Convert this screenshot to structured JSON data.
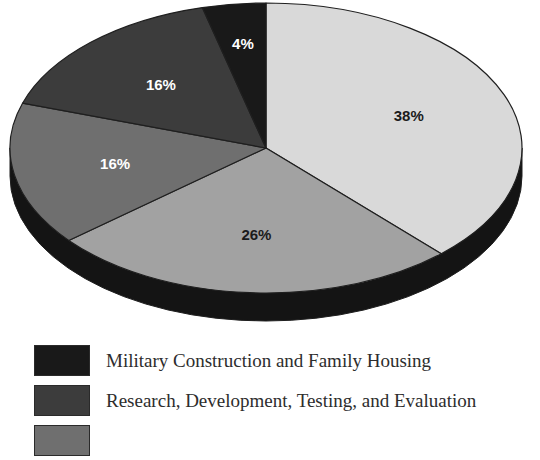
{
  "chart_data": {
    "type": "pie",
    "title": "",
    "subtitle": "",
    "xlabel": "",
    "ylabel": "",
    "legend_position": "bottom-left",
    "three_d": true,
    "start_angle_deg": 0,
    "direction": "clockwise",
    "labels_shown_on_slices": true,
    "categories": [
      "Military Personnel",
      "Operations and Maintenance",
      "Procurement",
      "Research, Development, Testing, and Evaluation",
      "Military Construction and Family Housing"
    ],
    "values": [
      38,
      26,
      16,
      16,
      4
    ],
    "slices": [
      {
        "index": 0,
        "percent_label": "38%",
        "value": 38,
        "color": "#d9d9d9",
        "label_color": "#1b1b1b",
        "start_pct": 0,
        "end_pct": 38
      },
      {
        "index": 1,
        "percent_label": "26%",
        "value": 26,
        "color": "#a2a2a2",
        "label_color": "#1b1b1b",
        "start_pct": 38,
        "end_pct": 64
      },
      {
        "index": 2,
        "percent_label": "16%",
        "value": 16,
        "color": "#6f6f6f",
        "label_color": "#ffffff",
        "start_pct": 64,
        "end_pct": 80
      },
      {
        "index": 3,
        "percent_label": "16%",
        "value": 16,
        "color": "#3c3c3c",
        "label_color": "#ffffff",
        "start_pct": 80,
        "end_pct": 96
      },
      {
        "index": 4,
        "percent_label": "4%",
        "value": 4,
        "color": "#191919",
        "label_color": "#ffffff",
        "start_pct": 96,
        "end_pct": 100
      }
    ],
    "side_color": "#141414",
    "outline_color": "#1f1f1f",
    "background": "#ffffff"
  },
  "legend": {
    "items": [
      {
        "label": "Military Construction and Family Housing",
        "swatch_color": "#191919"
      },
      {
        "label": "Research, Development, Testing, and Evaluation",
        "swatch_color": "#3c3c3c"
      },
      {
        "label": "",
        "swatch_color": "#6f6f6f"
      }
    ]
  }
}
